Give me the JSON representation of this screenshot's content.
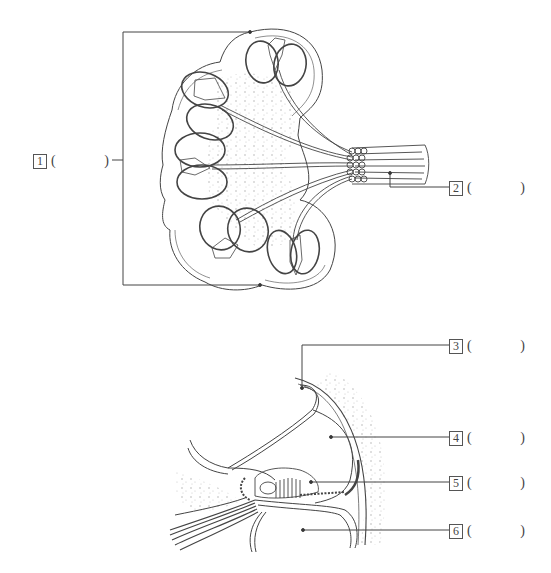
{
  "figure": {
    "top_diagram": "cochlea-cross-section",
    "bottom_diagram": "cochlear-duct-detail"
  },
  "labels": [
    {
      "number": "1",
      "open": "(",
      "answer": "",
      "close": ")"
    },
    {
      "number": "2",
      "open": "(",
      "answer": "",
      "close": ")"
    },
    {
      "number": "3",
      "open": "(",
      "answer": "",
      "close": ")"
    },
    {
      "number": "4",
      "open": "(",
      "answer": "",
      "close": ")"
    },
    {
      "number": "5",
      "open": "(",
      "answer": "",
      "close": ")"
    },
    {
      "number": "6",
      "open": "(",
      "answer": "",
      "close": ")"
    }
  ],
  "colors": {
    "line": "#444444",
    "stipple": "#b5b5b5",
    "background": "#ffffff"
  }
}
